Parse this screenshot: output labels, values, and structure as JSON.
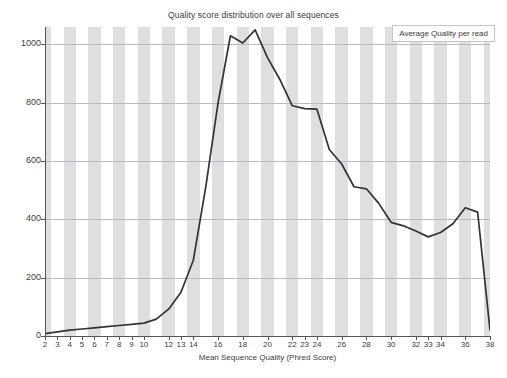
{
  "chart_data": {
    "type": "line",
    "title": "Quality score distribution over all sequences",
    "xlabel": "Mean Sequence Quality (Phred Score)",
    "ylabel": "",
    "xlim": [
      2,
      38
    ],
    "ylim": [
      0,
      1060
    ],
    "grid": true,
    "legend_position": "top-right",
    "series": [
      {
        "name": "Average Quality per read",
        "color": "#333333",
        "x": [
          2,
          3,
          4,
          5,
          6,
          7,
          8,
          9,
          10,
          11,
          12,
          13,
          14,
          15,
          16,
          17,
          18,
          19,
          20,
          21,
          22,
          23,
          24,
          25,
          26,
          27,
          28,
          29,
          30,
          31,
          32,
          33,
          34,
          35,
          36,
          37,
          38
        ],
        "values": [
          8,
          14,
          20,
          24,
          28,
          32,
          36,
          40,
          44,
          58,
          92,
          150,
          260,
          510,
          800,
          1030,
          1005,
          1050,
          955,
          880,
          790,
          780,
          778,
          640,
          590,
          512,
          505,
          455,
          390,
          378,
          360,
          340,
          355,
          385,
          440,
          425,
          20
        ]
      }
    ],
    "x_tick_labels": [
      "2",
      "3",
      "4",
      "5",
      "6",
      "7",
      "8",
      "9",
      "10",
      "12",
      "13",
      "14",
      "16",
      "18",
      "20",
      "22",
      "23",
      "24",
      "26",
      "28",
      "30",
      "32",
      "33",
      "34",
      "36",
      "38"
    ],
    "x_tick_values": [
      2,
      3,
      4,
      5,
      6,
      7,
      8,
      9,
      10,
      12,
      13,
      14,
      16,
      18,
      20,
      22,
      23,
      24,
      26,
      28,
      30,
      32,
      33,
      34,
      36,
      38
    ],
    "y_tick_labels": [
      "0",
      "200",
      "400",
      "600",
      "800",
      "1000"
    ],
    "y_tick_values": [
      0,
      200,
      400,
      600,
      800,
      1000
    ],
    "band_color": "#d9d9d9",
    "gridline_color": "#b9b9c4",
    "axis_color": "#555555",
    "background": "#ffffff"
  },
  "legend": {
    "label": "Average Quality per read"
  }
}
